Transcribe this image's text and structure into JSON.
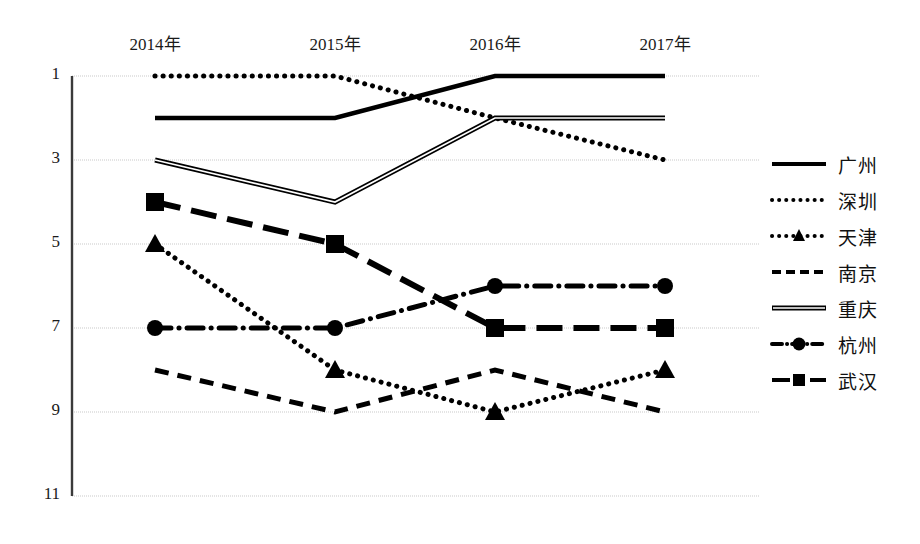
{
  "chart_data": {
    "type": "line",
    "title": "",
    "xlabel": "",
    "ylabel": "",
    "categories": [
      "2014年",
      "2015年",
      "2016年",
      "2017年"
    ],
    "x_tick_labels": [
      "2014年",
      "2015年",
      "2016年",
      "2017年"
    ],
    "y_tick_labels": [
      "1",
      "3",
      "5",
      "7",
      "9",
      "11"
    ],
    "y_tick_values": [
      1,
      3,
      5,
      7,
      9,
      11
    ],
    "ylim": [
      1,
      11
    ],
    "y_axis_inverted": true,
    "grid": "horizontal",
    "legend_position": "right",
    "series": [
      {
        "name": "广州",
        "values": [
          2,
          2,
          1,
          1
        ],
        "style": "solid",
        "marker": "none",
        "color": "#000000"
      },
      {
        "name": "深圳",
        "values": [
          1,
          1,
          2,
          3
        ],
        "style": "dotted",
        "marker": "none",
        "color": "#000000"
      },
      {
        "name": "天津",
        "values": [
          5,
          8,
          9,
          8
        ],
        "style": "dotted",
        "marker": "triangle",
        "color": "#000000"
      },
      {
        "name": "南京",
        "values": [
          8,
          9,
          8,
          9
        ],
        "style": "dashed",
        "marker": "none",
        "color": "#000000"
      },
      {
        "name": "重庆",
        "values": [
          3,
          4,
          2,
          2
        ],
        "style": "double",
        "marker": "none",
        "color": "#000000"
      },
      {
        "name": "杭州",
        "values": [
          7,
          7,
          6,
          6
        ],
        "style": "dash-dot",
        "marker": "circle",
        "color": "#000000"
      },
      {
        "name": "武汉",
        "values": [
          4,
          5,
          7,
          7
        ],
        "style": "long-dash",
        "marker": "square",
        "color": "#000000"
      }
    ]
  },
  "legend": {
    "items": [
      {
        "label": "广州"
      },
      {
        "label": "深圳"
      },
      {
        "label": "天津"
      },
      {
        "label": "南京"
      },
      {
        "label": "重庆"
      },
      {
        "label": "杭州"
      },
      {
        "label": "武汉"
      }
    ]
  },
  "colors": {
    "ink": "#000000",
    "grid": "#c9c9c9",
    "axis": "#555555",
    "background": "#ffffff"
  }
}
